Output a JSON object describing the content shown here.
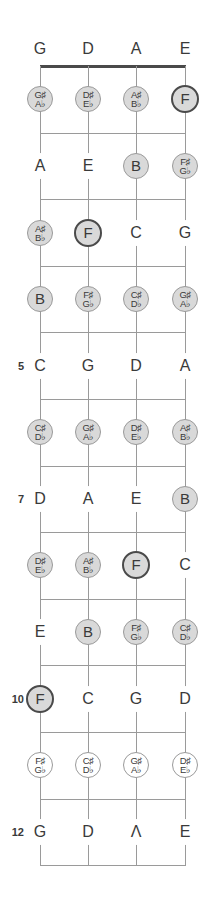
{
  "diagram": {
    "strings": [
      "G",
      "D",
      "A",
      "E"
    ],
    "colors": {
      "line": "#9a9a9a",
      "nut": "#4a4a4a",
      "gray_fill": "#d9d9d9",
      "root_border": "#4a4a4a",
      "text": "#3a3a3a"
    },
    "fret_markers": [
      {
        "fret": 5,
        "label": "5"
      },
      {
        "fret": 7,
        "label": "7"
      },
      {
        "fret": 10,
        "label": "10"
      },
      {
        "fret": 12,
        "label": "12"
      }
    ],
    "frets": [
      {
        "fret": 1,
        "notes": [
          {
            "sharp": "G♯",
            "flat": "A♭",
            "style": "gray"
          },
          {
            "sharp": "D♯",
            "flat": "E♭",
            "style": "gray"
          },
          {
            "sharp": "A♯",
            "flat": "B♭",
            "style": "gray"
          },
          {
            "name": "F",
            "style": "root"
          }
        ]
      },
      {
        "fret": 2,
        "notes": [
          {
            "name": "A",
            "style": "plain"
          },
          {
            "name": "E",
            "style": "plain"
          },
          {
            "name": "B",
            "style": "gray"
          },
          {
            "sharp": "F♯",
            "flat": "G♭",
            "style": "gray"
          }
        ]
      },
      {
        "fret": 3,
        "notes": [
          {
            "sharp": "A♯",
            "flat": "B♭",
            "style": "gray"
          },
          {
            "name": "F",
            "style": "root"
          },
          {
            "name": "C",
            "style": "plain"
          },
          {
            "name": "G",
            "style": "plain"
          }
        ]
      },
      {
        "fret": 4,
        "notes": [
          {
            "name": "B",
            "style": "gray"
          },
          {
            "sharp": "F♯",
            "flat": "G♭",
            "style": "gray"
          },
          {
            "sharp": "C♯",
            "flat": "D♭",
            "style": "gray"
          },
          {
            "sharp": "G♯",
            "flat": "A♭",
            "style": "gray"
          }
        ]
      },
      {
        "fret": 5,
        "notes": [
          {
            "name": "C",
            "style": "plain"
          },
          {
            "name": "G",
            "style": "plain"
          },
          {
            "name": "D",
            "style": "plain"
          },
          {
            "name": "A",
            "style": "plain"
          }
        ]
      },
      {
        "fret": 6,
        "notes": [
          {
            "sharp": "C♯",
            "flat": "D♭",
            "style": "gray"
          },
          {
            "sharp": "G♯",
            "flat": "A♭",
            "style": "gray"
          },
          {
            "sharp": "D♯",
            "flat": "E♭",
            "style": "gray"
          },
          {
            "sharp": "A♯",
            "flat": "B♭",
            "style": "gray"
          }
        ]
      },
      {
        "fret": 7,
        "notes": [
          {
            "name": "D",
            "style": "plain"
          },
          {
            "name": "A",
            "style": "plain"
          },
          {
            "name": "E",
            "style": "plain"
          },
          {
            "name": "B",
            "style": "gray"
          }
        ]
      },
      {
        "fret": 8,
        "notes": [
          {
            "sharp": "D♯",
            "flat": "E♭",
            "style": "gray"
          },
          {
            "sharp": "A♯",
            "flat": "B♭",
            "style": "gray"
          },
          {
            "name": "F",
            "style": "root"
          },
          {
            "name": "C",
            "style": "plain"
          }
        ]
      },
      {
        "fret": 9,
        "notes": [
          {
            "name": "E",
            "style": "plain"
          },
          {
            "name": "B",
            "style": "gray"
          },
          {
            "sharp": "F♯",
            "flat": "G♭",
            "style": "gray"
          },
          {
            "sharp": "C♯",
            "flat": "D♭",
            "style": "gray"
          }
        ]
      },
      {
        "fret": 10,
        "notes": [
          {
            "name": "F",
            "style": "root"
          },
          {
            "name": "C",
            "style": "plain"
          },
          {
            "name": "G",
            "style": "plain"
          },
          {
            "name": "D",
            "style": "plain"
          }
        ]
      },
      {
        "fret": 11,
        "notes": [
          {
            "sharp": "F♯",
            "flat": "G♭",
            "style": "white"
          },
          {
            "sharp": "C♯",
            "flat": "D♭",
            "style": "white"
          },
          {
            "sharp": "G♯",
            "flat": "A♭",
            "style": "white"
          },
          {
            "sharp": "D♯",
            "flat": "E♭",
            "style": "white"
          }
        ]
      },
      {
        "fret": 12,
        "notes": [
          {
            "name": "G",
            "style": "plain"
          },
          {
            "name": "D",
            "style": "plain"
          },
          {
            "name": "Λ",
            "style": "plain"
          },
          {
            "name": "E",
            "style": "plain"
          }
        ]
      }
    ]
  }
}
